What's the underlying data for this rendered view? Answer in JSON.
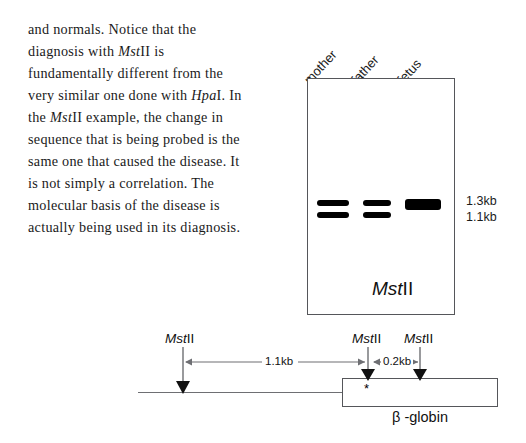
{
  "body_text": {
    "lines": [
      [
        {
          "t": "and normals. Notice that the",
          "i": false
        }
      ],
      [
        {
          "t": "diagnosis with ",
          "i": false
        },
        {
          "t": "Mst",
          "i": true
        },
        {
          "t": "II is",
          "i": false
        }
      ],
      [
        {
          "t": "fundamentally different from the",
          "i": false
        }
      ],
      [
        {
          "t": "very similar one done with ",
          "i": false
        },
        {
          "t": "Hpa",
          "i": true
        },
        {
          "t": "I. In",
          "i": false
        }
      ],
      [
        {
          "t": "the ",
          "i": false
        },
        {
          "t": "Mst",
          "i": true
        },
        {
          "t": "II example, the change in",
          "i": false
        }
      ],
      [
        {
          "t": "sequence that is being probed is the",
          "i": false
        }
      ],
      [
        {
          "t": "same one that caused the disease. It",
          "i": false
        }
      ],
      [
        {
          "t": "is not simply a correlation. The",
          "i": false
        }
      ],
      [
        {
          "t": "molecular basis of the disease is",
          "i": false
        }
      ],
      [
        {
          "t": "actually being used in its diagnosis.",
          "i": false
        }
      ]
    ]
  },
  "gel": {
    "lanes": [
      {
        "label": "mother",
        "bands": [
          "1.3kb",
          "1.1kb"
        ]
      },
      {
        "label": "father",
        "bands": [
          "1.3kb",
          "1.1kb"
        ]
      },
      {
        "label": "fetus",
        "bands": [
          "1.3kb"
        ]
      }
    ],
    "size_markers": [
      "1.3kb",
      "1.1kb"
    ],
    "enzyme_italic": "Mst",
    "enzyme_roman": "II"
  },
  "gene_map": {
    "sites": [
      {
        "name_italic": "Mst",
        "name_roman": "II"
      },
      {
        "name_italic": "Mst",
        "name_roman": "II"
      },
      {
        "name_italic": "Mst",
        "name_roman": "II"
      }
    ],
    "distances": [
      "1.1kb",
      "0.2kb"
    ],
    "mutation_marker": "*",
    "gene_label": "β -globin"
  },
  "colors": {
    "ink": "#111111",
    "box_stroke": "#55565a",
    "line_stroke": "#6e6f73",
    "band_fill": "#000000",
    "page_bg": "#ffffff"
  }
}
